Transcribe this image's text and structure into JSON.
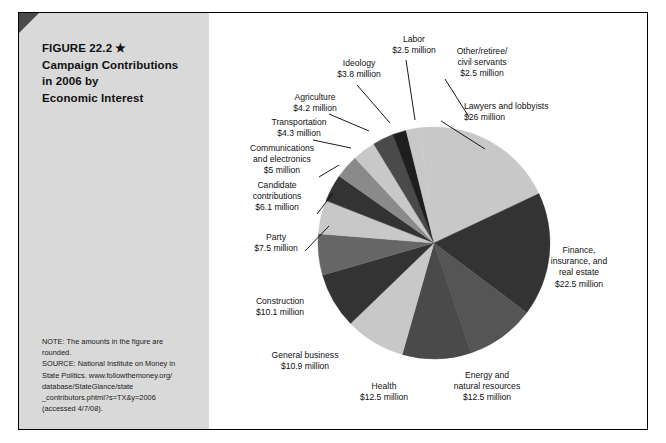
{
  "figure": {
    "title_line1": "FIGURE 22.2",
    "title_star": "★",
    "title_line2": "Campaign Contributions",
    "title_line3": "in 2006 by",
    "title_line4": "Economic Interest",
    "note": "NOTE: The amounts in the figure are\nrounded.",
    "source": "SOURCE: National Institute on Money in\nState Politics. www.followthemoney.org/\ndatabase/StateGlance/state\n_contributors.phtml?s=TX&y=2006\n(accessed 4/7/08)."
  },
  "chart_data": {
    "type": "pie",
    "title": "Campaign Contributions in 2006 by Economic Interest",
    "unit": "millions of dollars",
    "total": 127.9,
    "grid": false,
    "legend_position": "none (direct labels with leader lines)",
    "categories": [
      "Lawyers and lobbyists",
      "Finance, insurance, and real estate",
      "Energy and natural resources",
      "Health",
      "General business",
      "Construction",
      "Party",
      "Candidate contributions",
      "Communications and electronics",
      "Transportation",
      "Agriculture",
      "Ideology",
      "Labor",
      "Other/retiree/civil servants"
    ],
    "values": [
      26,
      22.5,
      12.5,
      12.5,
      10.9,
      10.1,
      7.5,
      6.1,
      5,
      4.3,
      4.2,
      3.8,
      2.5,
      2.5
    ],
    "colors": [
      "#c8c8c8",
      "#333333",
      "#555555",
      "#4a4a4a",
      "#c8c8c8",
      "#333333",
      "#666666",
      "#c8c8c8",
      "#333333",
      "#8a8a8a",
      "#c8c8c8",
      "#4a4a4a",
      "#1e1e1e",
      "#c8c8c8"
    ],
    "slices": [
      {
        "label": "Lawyers and lobbyists",
        "value_text": "$26 million",
        "value": 26
      },
      {
        "label": "Finance,\ninsurance, and\nreal estate",
        "value_text": "$22.5 million",
        "value": 22.5
      },
      {
        "label": "Energy and\nnatural resources",
        "value_text": "$12.5 million",
        "value": 12.5
      },
      {
        "label": "Health",
        "value_text": "$12.5 million",
        "value": 12.5
      },
      {
        "label": "General business",
        "value_text": "$10.9 million",
        "value": 10.9
      },
      {
        "label": "Construction",
        "value_text": "$10.1 million",
        "value": 10.1
      },
      {
        "label": "Party",
        "value_text": "$7.5 million",
        "value": 7.5
      },
      {
        "label": "Candidate\ncontributions",
        "value_text": "$6.1 million",
        "value": 6.1
      },
      {
        "label": "Communications\nand electronics",
        "value_text": "$5 million",
        "value": 5
      },
      {
        "label": "Transportation",
        "value_text": "$4.3 million",
        "value": 4.3
      },
      {
        "label": "Agriculture",
        "value_text": "$4.2 million",
        "value": 4.2
      },
      {
        "label": "Ideology",
        "value_text": "$3.8 million",
        "value": 3.8
      },
      {
        "label": "Labor",
        "value_text": "$2.5 million",
        "value": 2.5
      },
      {
        "label": "Other/retiree/\ncivil servants",
        "value_text": "$2.5 million",
        "value": 2.5
      }
    ]
  },
  "labels": {
    "lawyers": "Lawyers and lobbyists\n$26 million",
    "finance": "Finance,\ninsurance, and\nreal estate\n$22.5 million",
    "energy": "Energy and\nnatural resources\n$12.5 million",
    "health": "Health\n$12.5 million",
    "general_business": "General business\n$10.9 million",
    "construction": "Construction\n$10.1 million",
    "party": "Party\n$7.5 million",
    "candidate": "Candidate\ncontributions\n$6.1 million",
    "communications": "Communications\nand electronics\n$5 million",
    "transportation": "Transportation\n$4.3 million",
    "agriculture": "Agriculture\n$4.2 million",
    "ideology": "Ideology\n$3.8 million",
    "labor": "Labor\n$2.5 million",
    "other": "Other/retiree/\ncivil servants\n$2.5 million"
  }
}
